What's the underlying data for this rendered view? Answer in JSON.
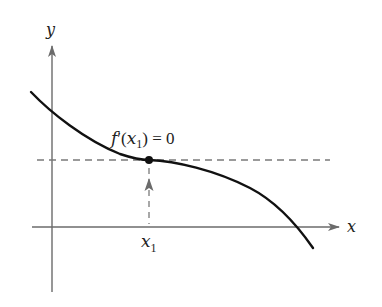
{
  "diagram": {
    "title": "",
    "axes": {
      "x_label": "x",
      "y_label": "y",
      "axis_color": "#6b6b6b"
    },
    "curve": {
      "description": "Decreasing function with horizontal tangent at x1",
      "color": "#111111"
    },
    "point": {
      "label_f": "f",
      "label_prime": "′",
      "label_open": "(",
      "label_x": "x",
      "label_sub": "1",
      "label_close": ")",
      "label_eq": " = 0",
      "full_label": "f′(x1) = 0"
    },
    "tick_label": {
      "x": "x",
      "sub": "1"
    },
    "tangent_line": {
      "style": "dashed",
      "color": "#7a7a7a"
    },
    "vertical_guide": {
      "style": "dashed",
      "direction": "up",
      "color": "#7a7a7a"
    }
  }
}
